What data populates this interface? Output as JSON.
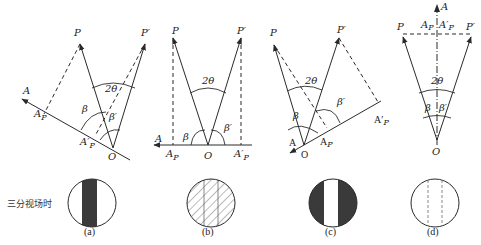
{
  "figure": {
    "side_label": "三分视场时",
    "colors": {
      "line": "#2a2a2a",
      "dark_fill": "#3a3a3a",
      "background": "#ffffff"
    },
    "panels": [
      {
        "id": "a",
        "caption": "(a)",
        "labels": {
          "P": "P",
          "P_prime": "P′",
          "A": "A",
          "A_P": "A",
          "A_P_sub": "P",
          "A_prime_P": "A′",
          "A_prime_P_sub": "P",
          "O": "O",
          "two_theta": "2θ",
          "beta": "β",
          "beta_prime": "β′"
        },
        "field_view": "dark-center-stripe"
      },
      {
        "id": "b",
        "caption": "(b)",
        "labels": {
          "P": "P",
          "P_prime": "P′",
          "A": "A",
          "A_P": "A",
          "A_P_sub": "P",
          "A_prime_P": "A′",
          "A_prime_P_sub": "P",
          "O": "O",
          "two_theta": "2θ",
          "beta": "β",
          "beta_prime": "β′"
        },
        "field_view": "uniform-hatched"
      },
      {
        "id": "c",
        "caption": "(c)",
        "labels": {
          "P": "P",
          "P_prime": "P′",
          "A": "A",
          "A_P": "A",
          "A_P_sub": "P",
          "A_prime_P": "A′",
          "A_prime_P_sub": "P",
          "O": "O",
          "two_theta": "2θ",
          "beta": "β",
          "beta_prime": "β′"
        },
        "field_view": "light-center-stripe"
      },
      {
        "id": "d",
        "caption": "(d)",
        "labels": {
          "P": "P",
          "P_prime": "P′",
          "A": "A",
          "A_P": "A",
          "A_P_sub": "P",
          "A_prime_P": "A′",
          "A_prime_P_sub": "P",
          "O": "O",
          "two_theta": "2θ",
          "beta": "β",
          "beta_prime": "β′"
        },
        "field_view": "uniform-light"
      }
    ]
  }
}
